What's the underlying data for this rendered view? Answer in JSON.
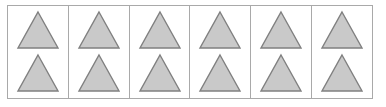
{
  "figure": {
    "type": "grouped-object-array",
    "shape_name": "triangle",
    "cell_count": 6,
    "shapes_per_cell": 2,
    "total_shapes": 12,
    "colors": {
      "background": "#ffffff",
      "frame_border": "#a9a9a9",
      "cell_divider": "#a9a9a9",
      "shape_fill": "#c9c9c9",
      "shape_stroke": "#808080"
    },
    "cells": [
      {
        "index": 1,
        "label": "group-1",
        "shapes": [
          {
            "name": "triangle",
            "position": "top"
          },
          {
            "name": "triangle",
            "position": "bottom"
          }
        ]
      },
      {
        "index": 2,
        "label": "group-2",
        "shapes": [
          {
            "name": "triangle",
            "position": "top"
          },
          {
            "name": "triangle",
            "position": "bottom"
          }
        ]
      },
      {
        "index": 3,
        "label": "group-3",
        "shapes": [
          {
            "name": "triangle",
            "position": "top"
          },
          {
            "name": "triangle",
            "position": "bottom"
          }
        ]
      },
      {
        "index": 4,
        "label": "group-4",
        "shapes": [
          {
            "name": "triangle",
            "position": "top"
          },
          {
            "name": "triangle",
            "position": "bottom"
          }
        ]
      },
      {
        "index": 5,
        "label": "group-5",
        "shapes": [
          {
            "name": "triangle",
            "position": "top"
          },
          {
            "name": "triangle",
            "position": "bottom"
          }
        ]
      },
      {
        "index": 6,
        "label": "group-6",
        "shapes": [
          {
            "name": "triangle",
            "position": "top"
          },
          {
            "name": "triangle",
            "position": "bottom"
          }
        ]
      }
    ]
  }
}
